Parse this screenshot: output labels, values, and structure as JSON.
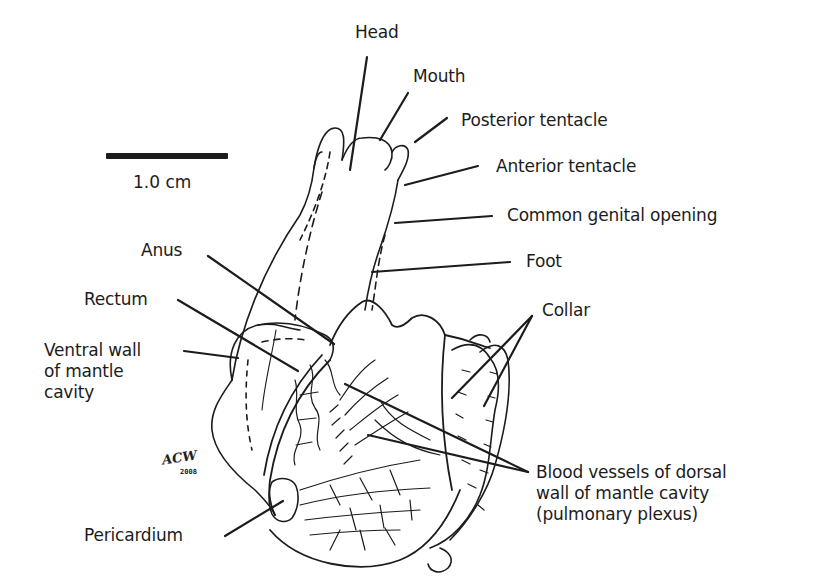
{
  "figure": {
    "scale_bar": {
      "label": "1.0 cm"
    },
    "signature": {
      "initials": "ACW",
      "year": "2008"
    },
    "labels": {
      "head": "Head",
      "mouth": "Mouth",
      "posterior_tentacle": "Posterior tentacle",
      "anterior_tentacle": "Anterior tentacle",
      "common_genital_opening": "Common genital opening",
      "foot": "Foot",
      "anus": "Anus",
      "rectum": "Rectum",
      "ventral_wall": "Ventral wall\nof mantle\ncavity",
      "collar": "Collar",
      "blood_vessels": "Blood vessels of dorsal\nwall of mantle cavity\n(pulmonary plexus)",
      "pericardium": "Pericardium"
    },
    "colors": {
      "ink": "#1c1c1c",
      "background": "#ffffff"
    }
  }
}
